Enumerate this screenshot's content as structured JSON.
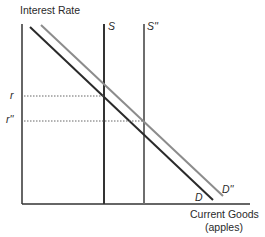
{
  "diagram": {
    "type": "supply-demand",
    "y_axis_label": "Interest Rate",
    "x_axis_label_line1": "Current Goods",
    "x_axis_label_line2": "(apples)",
    "curves": {
      "supply": "S",
      "supply_shifted": "S''",
      "demand": "D",
      "demand_shifted": "D''"
    },
    "rate_labels": {
      "r": "r",
      "r_shifted": "r''"
    },
    "colors": {
      "axis": "#333333",
      "demand": "#2a2a2a",
      "demand_shifted": "#8c8c8c",
      "supply": "#333333",
      "supply_shifted": "#6e6e6e",
      "guide": "#666666"
    }
  }
}
